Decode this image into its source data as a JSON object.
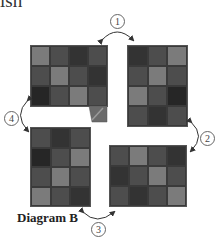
{
  "header": {
    "cut_text": "ish"
  },
  "diagram": {
    "label": "Diagram B",
    "steps": [
      {
        "number": "1"
      },
      {
        "number": "2"
      },
      {
        "number": "3"
      },
      {
        "number": "4"
      }
    ],
    "palette": {
      "light": "#7b7b7b",
      "mid": "#4d4d4d",
      "dark": "#333333",
      "darker": "#262626"
    },
    "grids": [
      {
        "id": "top-left",
        "cols": 4,
        "rows": 3,
        "cells": [
          "light",
          "mid",
          "dark",
          "mid",
          "mid",
          "light",
          "mid",
          "dark",
          "darker",
          "mid",
          "light",
          "mid"
        ]
      },
      {
        "id": "top-right",
        "cols": 3,
        "rows": 4,
        "cells": [
          "dark",
          "mid",
          "light",
          "mid",
          "light",
          "mid",
          "light",
          "mid",
          "darker",
          "mid",
          "dark",
          "mid"
        ]
      },
      {
        "id": "bottom-left",
        "cols": 3,
        "rows": 4,
        "cells": [
          "mid",
          "dark",
          "mid",
          "darker",
          "mid",
          "light",
          "mid",
          "light",
          "mid",
          "light",
          "mid",
          "dark"
        ]
      },
      {
        "id": "bottom-right",
        "cols": 4,
        "rows": 3,
        "cells": [
          "mid",
          "light",
          "mid",
          "dark",
          "dark",
          "mid",
          "light",
          "mid",
          "mid",
          "dark",
          "mid",
          "light"
        ]
      }
    ]
  }
}
